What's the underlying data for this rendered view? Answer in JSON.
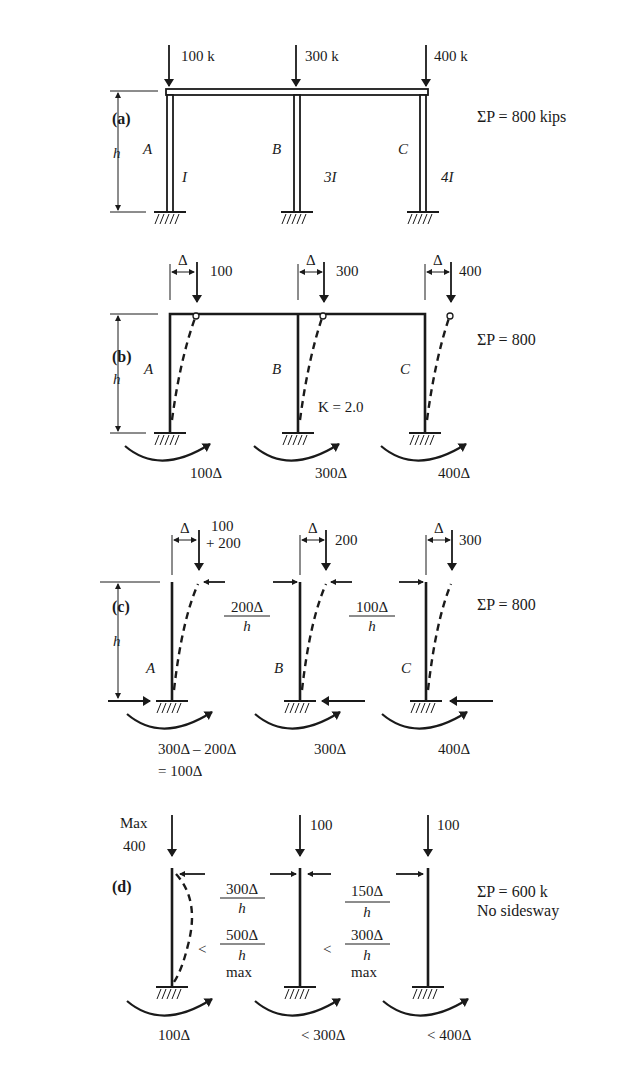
{
  "panels": {
    "a": {
      "label": "(a)",
      "height_label": "h",
      "loads": [
        "100 k",
        "300 k",
        "400 k"
      ],
      "columns": [
        "A",
        "B",
        "C"
      ],
      "inertias": [
        "I",
        "3I",
        "4I"
      ],
      "sum": "ΣP = 800 kips"
    },
    "b": {
      "label": "(b)",
      "height_label": "h",
      "delta": "Δ",
      "loads": [
        "100",
        "300",
        "400"
      ],
      "columns": [
        "A",
        "B",
        "C"
      ],
      "k_factor": "K = 2.0",
      "moments": [
        "100Δ",
        "300Δ",
        "400Δ"
      ],
      "sum": "ΣP = 800"
    },
    "c": {
      "label": "(c)",
      "height_label": "h",
      "delta": "Δ",
      "loads": [
        "100",
        "+ 200",
        "200",
        "300"
      ],
      "columns": [
        "A",
        "B",
        "C"
      ],
      "shear1_num": "200Δ",
      "shear1_den": "h",
      "shear2_num": "100Δ",
      "shear2_den": "h",
      "moment_a_line1": "300Δ – 200Δ",
      "moment_a_line2": "= 100Δ",
      "moments": [
        "300Δ",
        "400Δ"
      ],
      "sum": "ΣP = 800"
    },
    "d": {
      "label": "(d)",
      "max_line1": "Max",
      "max_line2": "400",
      "loads": [
        "100",
        "100"
      ],
      "shear1_num": "300Δ",
      "shear1_den": "h",
      "shear1b_lt": "<",
      "shear1b_num": "500Δ",
      "shear1b_den": "h",
      "shear1b_max": "max",
      "shear2_num": "150Δ",
      "shear2_den": "h",
      "shear2b_lt": "<",
      "shear2b_num": "300Δ",
      "shear2b_den": "h",
      "shear2b_max": "max",
      "moments": [
        "100Δ",
        "< 300Δ",
        "< 400Δ"
      ],
      "sum": "ΣP = 600 k",
      "note": "No sidesway"
    }
  }
}
